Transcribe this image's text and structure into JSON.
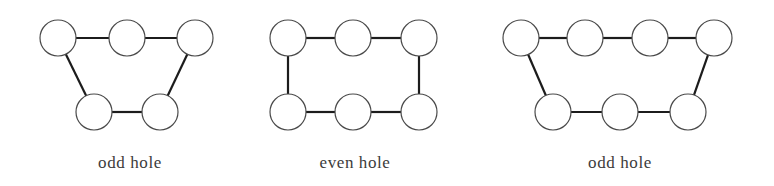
{
  "figure": {
    "width": 774,
    "height": 186,
    "background_color": "#ffffff",
    "edge_color": "#1c1c1c",
    "edge_width": 2.2,
    "node_stroke_color": "#4a4a4a",
    "node_fill_color": "#ffffff",
    "node_stroke_width": 1.2,
    "caption_color": "#3b3b3b",
    "caption_font_size": 17
  },
  "graphs": [
    {
      "id": "graph-odd-hole-left",
      "caption": "odd hole",
      "caption_x": 130,
      "caption_y": 168,
      "node_radius": 18,
      "node_count": 5,
      "parity": "odd",
      "nodes": [
        {
          "name": "node-top-1",
          "x": 58,
          "y": 38
        },
        {
          "name": "node-top-2",
          "x": 127,
          "y": 38
        },
        {
          "name": "node-top-3",
          "x": 195,
          "y": 38
        },
        {
          "name": "node-bottom-1",
          "x": 94,
          "y": 112
        },
        {
          "name": "node-bottom-2",
          "x": 160,
          "y": 112
        }
      ],
      "edges": [
        {
          "name": "edge-top-1-top-2",
          "from": 0,
          "to": 1
        },
        {
          "name": "edge-top-2-top-3",
          "from": 1,
          "to": 2
        },
        {
          "name": "edge-top-3-bottom-2",
          "from": 2,
          "to": 4
        },
        {
          "name": "edge-bottom-2-bottom-1",
          "from": 4,
          "to": 3
        },
        {
          "name": "edge-bottom-1-top-1",
          "from": 3,
          "to": 0
        }
      ]
    },
    {
      "id": "graph-even-hole-middle",
      "caption": "even hole",
      "caption_x": 355,
      "caption_y": 168,
      "node_radius": 18,
      "node_count": 6,
      "parity": "even",
      "nodes": [
        {
          "name": "node-top-1",
          "x": 288,
          "y": 38
        },
        {
          "name": "node-top-2",
          "x": 353,
          "y": 38
        },
        {
          "name": "node-top-3",
          "x": 419,
          "y": 38
        },
        {
          "name": "node-bottom-1",
          "x": 288,
          "y": 112
        },
        {
          "name": "node-bottom-2",
          "x": 353,
          "y": 112
        },
        {
          "name": "node-bottom-3",
          "x": 419,
          "y": 112
        }
      ],
      "edges": [
        {
          "name": "edge-top-1-top-2",
          "from": 0,
          "to": 1
        },
        {
          "name": "edge-top-2-top-3",
          "from": 1,
          "to": 2
        },
        {
          "name": "edge-top-3-bottom-3",
          "from": 2,
          "to": 5
        },
        {
          "name": "edge-bottom-3-bottom-2",
          "from": 5,
          "to": 4
        },
        {
          "name": "edge-bottom-2-bottom-1",
          "from": 4,
          "to": 3
        },
        {
          "name": "edge-bottom-1-top-1",
          "from": 3,
          "to": 0
        }
      ]
    },
    {
      "id": "graph-odd-hole-right",
      "caption": "odd hole",
      "caption_x": 620,
      "caption_y": 168,
      "node_radius": 18,
      "node_count": 7,
      "parity": "odd",
      "nodes": [
        {
          "name": "node-top-1",
          "x": 521,
          "y": 38
        },
        {
          "name": "node-top-2",
          "x": 585,
          "y": 38
        },
        {
          "name": "node-top-3",
          "x": 650,
          "y": 38
        },
        {
          "name": "node-top-4",
          "x": 714,
          "y": 38
        },
        {
          "name": "node-bottom-1",
          "x": 553,
          "y": 112
        },
        {
          "name": "node-bottom-2",
          "x": 620,
          "y": 112
        },
        {
          "name": "node-bottom-3",
          "x": 688,
          "y": 112
        }
      ],
      "edges": [
        {
          "name": "edge-top-1-top-2",
          "from": 0,
          "to": 1
        },
        {
          "name": "edge-top-2-top-3",
          "from": 1,
          "to": 2
        },
        {
          "name": "edge-top-3-top-4",
          "from": 2,
          "to": 3
        },
        {
          "name": "edge-top-4-bottom-3",
          "from": 3,
          "to": 6
        },
        {
          "name": "edge-bottom-3-bottom-2",
          "from": 6,
          "to": 5
        },
        {
          "name": "edge-bottom-2-bottom-1",
          "from": 5,
          "to": 4
        },
        {
          "name": "edge-bottom-1-top-1",
          "from": 4,
          "to": 0
        }
      ]
    }
  ]
}
